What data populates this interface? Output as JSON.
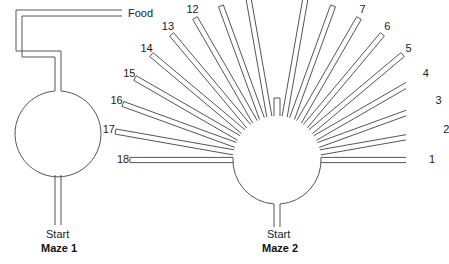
{
  "maze1": {
    "title": "Maze 1",
    "start_label": "Start",
    "food_label": "Food"
  },
  "maze2": {
    "title": "Maze 2",
    "start_label": "Start",
    "arms": [
      "1",
      "2",
      "3",
      "4",
      "5",
      "6",
      "7",
      "8",
      "9",
      "10",
      "11",
      "12",
      "13",
      "14",
      "15",
      "16",
      "17",
      "18"
    ]
  },
  "colors": {
    "line": "#555555",
    "text": "#222222"
  }
}
